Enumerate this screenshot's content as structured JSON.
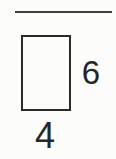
{
  "figure": {
    "type": "rectangle-with-dimension-labels",
    "shape": "rectangle",
    "height_label": "6",
    "width_label": "4",
    "colors": {
      "line": "#2b2b2b",
      "rule": "#3f3f3f",
      "text": "#262626",
      "background": "#fcfcfa"
    }
  }
}
